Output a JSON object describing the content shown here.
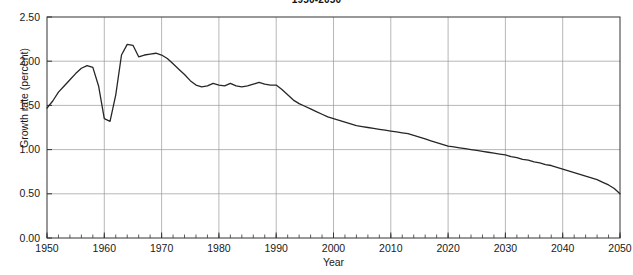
{
  "chart_data": {
    "type": "line",
    "title": "1950-2050",
    "xlabel": "Year",
    "ylabel": "Growth rate (percent)",
    "xlim": [
      1950,
      2050
    ],
    "ylim": [
      0.0,
      2.5
    ],
    "grid": true,
    "legend": null,
    "xticks": [
      1950,
      1960,
      1970,
      1980,
      1990,
      2000,
      2010,
      2020,
      2030,
      2040,
      2050
    ],
    "xtick_labels": [
      "1950",
      "1960",
      "1970",
      "1980",
      "1990",
      "2000",
      "2010",
      "2020",
      "2030",
      "2040",
      "2050"
    ],
    "xminor_tick_interval": 2,
    "yticks": [
      0.0,
      0.5,
      1.0,
      1.5,
      2.0,
      2.5
    ],
    "ytick_labels": [
      "0.00",
      "0.50",
      "1.00",
      "1.50",
      "2.00",
      "2.50"
    ],
    "series": [
      {
        "name": "World population growth rate",
        "color": "#262626",
        "x": [
          1950,
          1951,
          1952,
          1953,
          1954,
          1955,
          1956,
          1957,
          1958,
          1959,
          1960,
          1961,
          1962,
          1963,
          1964,
          1965,
          1966,
          1967,
          1968,
          1969,
          1970,
          1971,
          1972,
          1973,
          1974,
          1975,
          1976,
          1977,
          1978,
          1979,
          1980,
          1981,
          1982,
          1983,
          1984,
          1985,
          1986,
          1987,
          1988,
          1989,
          1990,
          1991,
          1992,
          1993,
          1994,
          1995,
          1996,
          1997,
          1998,
          1999,
          2000,
          2001,
          2002,
          2003,
          2004,
          2005,
          2006,
          2007,
          2008,
          2009,
          2010,
          2011,
          2012,
          2013,
          2014,
          2015,
          2016,
          2017,
          2018,
          2019,
          2020,
          2021,
          2022,
          2023,
          2024,
          2025,
          2026,
          2027,
          2028,
          2029,
          2030,
          2031,
          2032,
          2033,
          2034,
          2035,
          2036,
          2037,
          2038,
          2039,
          2040,
          2041,
          2042,
          2043,
          2044,
          2045,
          2046,
          2047,
          2048,
          2049,
          2050
        ],
        "y": [
          1.47,
          1.55,
          1.65,
          1.72,
          1.79,
          1.86,
          1.92,
          1.95,
          1.93,
          1.72,
          1.35,
          1.32,
          1.62,
          2.07,
          2.19,
          2.18,
          2.05,
          2.07,
          2.08,
          2.09,
          2.07,
          2.03,
          1.97,
          1.91,
          1.85,
          1.78,
          1.73,
          1.71,
          1.72,
          1.75,
          1.73,
          1.72,
          1.75,
          1.72,
          1.71,
          1.72,
          1.74,
          1.76,
          1.74,
          1.73,
          1.73,
          1.68,
          1.62,
          1.56,
          1.52,
          1.49,
          1.46,
          1.43,
          1.4,
          1.37,
          1.35,
          1.33,
          1.31,
          1.29,
          1.27,
          1.26,
          1.25,
          1.24,
          1.23,
          1.22,
          1.21,
          1.2,
          1.19,
          1.18,
          1.16,
          1.14,
          1.12,
          1.1,
          1.08,
          1.06,
          1.04,
          1.03,
          1.02,
          1.01,
          1.0,
          0.99,
          0.98,
          0.97,
          0.96,
          0.95,
          0.94,
          0.92,
          0.91,
          0.89,
          0.88,
          0.86,
          0.85,
          0.83,
          0.82,
          0.8,
          0.78,
          0.76,
          0.74,
          0.72,
          0.7,
          0.68,
          0.66,
          0.63,
          0.6,
          0.56,
          0.5
        ]
      }
    ]
  },
  "style": {
    "line_color": "#262626",
    "grid_color": "#999999",
    "frame_color": "#333333",
    "text_color": "#1a1a1a",
    "background": "#ffffff"
  }
}
